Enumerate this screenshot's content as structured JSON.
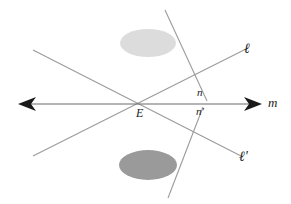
{
  "figure": {
    "background_color": "#ffffff",
    "width": 291,
    "height": 204,
    "labels": {
      "line_m": "m",
      "line_l": "ℓ",
      "line_l_prime": "ℓ'",
      "line_n": "n",
      "line_n_prime": "n'",
      "point_E": "E"
    },
    "colors": {
      "line_stroke": "#9b9b9b",
      "axis_stroke": "#6b6b6b",
      "arrow_fill": "#1a1a1a",
      "ellipse_top_fill": "#dcdcdc",
      "ellipse_bottom_fill": "#9a9a9a",
      "label_color": "#1a1a1a"
    },
    "geometry": {
      "point_E": {
        "x": 142,
        "y": 104
      },
      "line_m": {
        "x1": 20,
        "y1": 104,
        "x2": 260,
        "y2": 104,
        "arrows": "both"
      },
      "line_l": {
        "x1": 33,
        "y1": 156,
        "x2": 248,
        "y2": 48
      },
      "line_l_prime": {
        "x1": 33,
        "y1": 50,
        "x2": 243,
        "y2": 157
      },
      "line_n": {
        "x1": 165,
        "y1": 10,
        "x2": 207,
        "y2": 101
      },
      "line_n_prime": {
        "x1": 203,
        "y1": 107,
        "x2": 168,
        "y2": 198
      },
      "ellipse_top": {
        "cx": 148,
        "cy": 43,
        "rx": 28,
        "ry": 14
      },
      "ellipse_bottom": {
        "cx": 148,
        "cy": 165,
        "rx": 29,
        "ry": 15
      },
      "arrow_left": {
        "tip_x": 18,
        "base_x": 35,
        "y": 104
      },
      "arrow_right": {
        "tip_x": 262,
        "base_x": 245,
        "y": 104
      }
    }
  }
}
